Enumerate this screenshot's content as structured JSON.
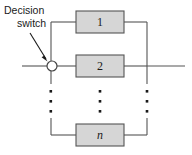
{
  "figure": {
    "type": "block-diagram",
    "name": "parallel-redundancy-with-decision-switch",
    "canvas": {
      "width": 192,
      "height": 155
    },
    "background_color": "#ffffff",
    "line_color": "#555555",
    "block_fill_color": "#d6d6d6",
    "text_color": "#1a1a1a"
  },
  "annotation": {
    "name": "decision-switch-callout",
    "line1": "Decision",
    "line2": "switch",
    "arrow": "points down-right to the switch node"
  },
  "blocks": [
    {
      "label": "1",
      "italic": false,
      "x": 76,
      "y": 11,
      "w": 48,
      "h": 22
    },
    {
      "label": "2",
      "italic": false,
      "x": 76,
      "y": 55,
      "w": 48,
      "h": 22
    },
    {
      "label": "n",
      "italic": true,
      "x": 76,
      "y": 124,
      "w": 48,
      "h": 22
    }
  ],
  "ellipses": [
    {
      "name": "left-bus-ellipsis",
      "x": 51,
      "dots": 3
    },
    {
      "name": "center-ellipsis",
      "x": 100,
      "dots": 3
    },
    {
      "name": "right-bus-ellipsis",
      "x": 147,
      "dots": 3
    }
  ],
  "nodes": [
    {
      "name": "decision-switch-node",
      "shape": "circle",
      "cx": 52,
      "cy": 66,
      "r": 5
    }
  ],
  "wires": {
    "input_line": "from left edge to switch node at y=66",
    "output_line": "from right bus to right edge at y=66",
    "left_bus_x": 51,
    "right_bus_x": 147,
    "main_line_y": 66
  }
}
